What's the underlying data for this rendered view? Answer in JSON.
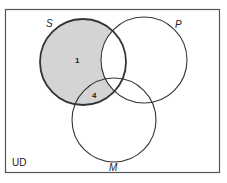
{
  "diagram": {
    "type": "venn",
    "universe_label": "UD",
    "colors": {
      "shade": "#d4d4d4",
      "stroke": "#333333",
      "frame": "#555555",
      "background": "#ffffff"
    },
    "sets": [
      {
        "id": "S",
        "label": "S",
        "cx": 83,
        "cy": 62,
        "r": 43,
        "emphasized": true
      },
      {
        "id": "P",
        "label": "P",
        "cx": 144,
        "cy": 60,
        "r": 43,
        "emphasized": false
      },
      {
        "id": "M",
        "label": "M",
        "cx": 114,
        "cy": 120,
        "r": 42,
        "emphasized": false
      }
    ],
    "shaded_region": "S minus P",
    "region_labels": [
      {
        "region": "S only",
        "text": "1",
        "x": 76,
        "y": 63
      },
      {
        "region": "S and M, not P",
        "text": "4",
        "x": 92,
        "y": 98
      }
    ]
  }
}
